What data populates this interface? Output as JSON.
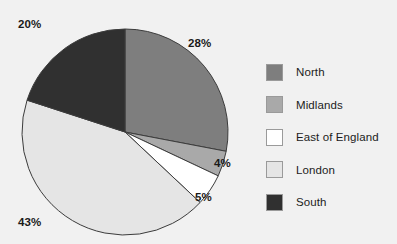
{
  "chart_data": {
    "type": "pie",
    "title": "",
    "categories": [
      "North",
      "Midlands",
      "East of England",
      "London",
      "South"
    ],
    "values": [
      28,
      4,
      5,
      43,
      20
    ],
    "value_labels": [
      "28%",
      "4%",
      "5%",
      "43%",
      "20%"
    ],
    "colors": [
      "#7e7e7e",
      "#a9a9a9",
      "#ffffff",
      "#e5e5e5",
      "#303030"
    ],
    "legend_position": "right",
    "grid": false,
    "start_angle_deg": 0,
    "direction": "clockwise",
    "slice_outline_color": "#3c3c3c"
  },
  "pie": {
    "labels": [
      {
        "text": "20%",
        "name": "pie-label-south",
        "left": "18px",
        "top": "18px"
      },
      {
        "text": "28%",
        "name": "pie-label-north",
        "left": "188px",
        "top": "37px"
      },
      {
        "text": "4%",
        "name": "pie-label-midlands",
        "left": "214px",
        "top": "157px"
      },
      {
        "text": "5%",
        "name": "pie-label-east-of-england",
        "left": "195px",
        "top": "191px"
      },
      {
        "text": "43%",
        "name": "pie-label-london",
        "left": "18px",
        "top": "216px"
      }
    ]
  },
  "legend": {
    "items": [
      {
        "label": "North",
        "color": "#7e7e7e"
      },
      {
        "label": "Midlands",
        "color": "#a9a9a9"
      },
      {
        "label": "East of England",
        "color": "#ffffff"
      },
      {
        "label": "London",
        "color": "#e5e5e5"
      },
      {
        "label": "South",
        "color": "#303030"
      }
    ]
  }
}
